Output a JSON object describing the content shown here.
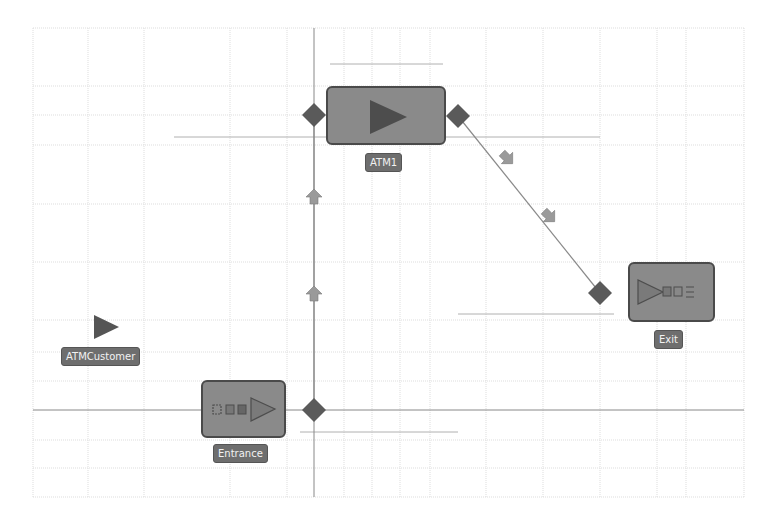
{
  "diagram": {
    "grid": {
      "left": 33,
      "top": 28,
      "right": 744,
      "bottom": 497,
      "v_lines": [
        33,
        88,
        144,
        230,
        287,
        344,
        372,
        400,
        430,
        486,
        543,
        600,
        657,
        686,
        744
      ],
      "h_lines": [
        28,
        86,
        115,
        145,
        204,
        262,
        320,
        352,
        381,
        440,
        468,
        497
      ],
      "color": "#dddddd"
    },
    "axis_lines": {
      "vertical_x": 314,
      "horizontal_y": 410,
      "color": "#888888"
    },
    "guide_lines": [
      {
        "x1": 330,
        "y1": 64,
        "x2": 443,
        "y2": 64
      },
      {
        "x1": 174,
        "y1": 137,
        "x2": 600,
        "y2": 137
      },
      {
        "x1": 458,
        "y1": 314,
        "x2": 614,
        "y2": 314
      },
      {
        "x1": 300,
        "y1": 432,
        "x2": 458,
        "y2": 432
      }
    ],
    "blocks": [
      {
        "id": "entrance",
        "label": "Entrance",
        "type": "source",
        "x": 201,
        "y": 380,
        "w": 85,
        "h": 58
      },
      {
        "id": "atm1",
        "label": "ATM1",
        "type": "service",
        "x": 326,
        "y": 86,
        "w": 120,
        "h": 59
      },
      {
        "id": "exit",
        "label": "Exit",
        "type": "sink",
        "x": 628,
        "y": 262,
        "w": 87,
        "h": 60
      }
    ],
    "agent": {
      "label": "ATMCustomer",
      "icon": "agent-triangle-icon",
      "x": 106,
      "y": 327
    },
    "ports": [
      {
        "id": "entrance-out",
        "x": 314,
        "y": 410
      },
      {
        "id": "atm1-in",
        "x": 314,
        "y": 115
      },
      {
        "id": "atm1-out",
        "x": 458,
        "y": 116
      },
      {
        "id": "exit-in",
        "x": 600,
        "y": 293
      }
    ],
    "connections": [
      {
        "from": "entrance-out",
        "to": "atm1-in"
      },
      {
        "from": "atm1-out",
        "to": "exit-in"
      }
    ],
    "flow_arrows": [
      {
        "x": 314,
        "y": 197,
        "dir": "up"
      },
      {
        "x": 314,
        "y": 294,
        "dir": "up"
      },
      {
        "x": 507,
        "y": 158,
        "dir": "down-right"
      },
      {
        "x": 549,
        "y": 216,
        "dir": "down-right"
      }
    ],
    "colors": {
      "block_fill": "#8a8a8a",
      "block_border": "#4a4a4a",
      "port": "#5a5a5a",
      "label_bg": "#6e6e6e",
      "label_text": "#f2f2f2",
      "icon_dark": "#4d4d4d",
      "arrow": "#9a9a9a"
    }
  }
}
